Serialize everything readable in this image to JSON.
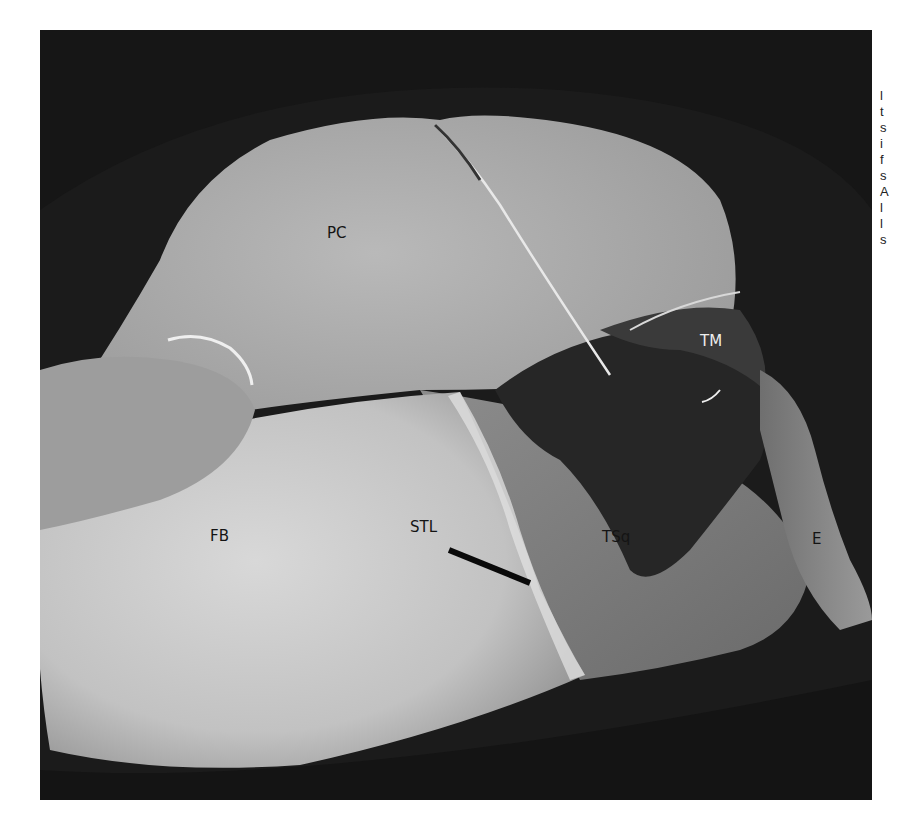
{
  "figure": {
    "labels": {
      "pc": "PC",
      "tm": "TM",
      "fb": "FB",
      "stl": "STL",
      "tsq": "TSq",
      "e": "E"
    },
    "colors": {
      "background": "#1c1c1c",
      "bone_light": "#cfcfcf",
      "tissue_mid": "#a9a9a9",
      "tissue_dark": "#2a2a2a",
      "label_dark": "#141414",
      "label_light": "#eeeeee"
    }
  },
  "caption": {
    "visible_line_starts": [
      "l",
      "t",
      "s",
      "i",
      "f",
      "s",
      "A",
      "l",
      "l",
      "s"
    ]
  }
}
